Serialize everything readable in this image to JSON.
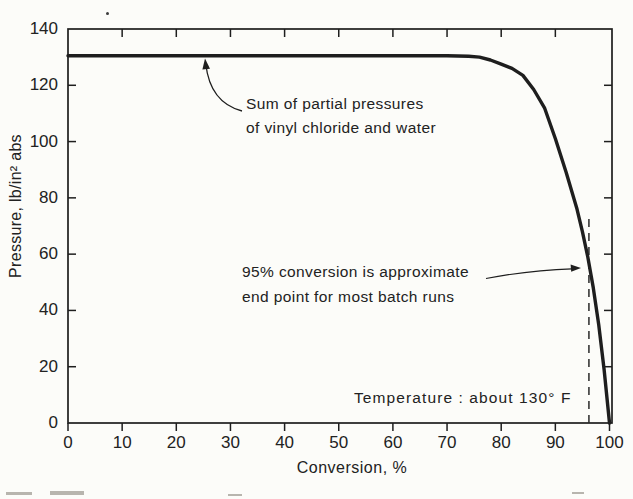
{
  "figure": {
    "background_color": "#fcfcf9",
    "ink_color": "#1e1e1e"
  },
  "chart_data": {
    "type": "line",
    "title": "",
    "xlabel": "Conversion, %",
    "ylabel": "Pressure, lb/in² abs",
    "xlim": [
      0,
      100
    ],
    "ylim": [
      0,
      140
    ],
    "x_ticks": [
      0,
      10,
      20,
      30,
      40,
      50,
      60,
      70,
      80,
      90,
      100
    ],
    "y_ticks": [
      0,
      20,
      40,
      60,
      80,
      100,
      120,
      140
    ],
    "grid": false,
    "frame": "box-with-inward-ticks",
    "legend_position": "none",
    "series": [
      {
        "name": "Sum of partial pressures of vinyl chloride and water",
        "points": [
          [
            0,
            130.5
          ],
          [
            10,
            130.5
          ],
          [
            20,
            130.5
          ],
          [
            30,
            130.5
          ],
          [
            40,
            130.5
          ],
          [
            50,
            130.5
          ],
          [
            60,
            130.5
          ],
          [
            70,
            130.5
          ],
          [
            74,
            130.3
          ],
          [
            76,
            130
          ],
          [
            78,
            129
          ],
          [
            80,
            127.5
          ],
          [
            82,
            126
          ],
          [
            84,
            123.5
          ],
          [
            86,
            118.5
          ],
          [
            88,
            112
          ],
          [
            90,
            101
          ],
          [
            92,
            89
          ],
          [
            94,
            76
          ],
          [
            95,
            68
          ],
          [
            96,
            59
          ],
          [
            97,
            48
          ],
          [
            98,
            35
          ],
          [
            99,
            19
          ],
          [
            100,
            0
          ]
        ]
      }
    ],
    "reference_line": {
      "style": "dashed-vertical",
      "x": 96.2,
      "y_from": 0,
      "y_to": 73,
      "meaning": "95% conversion end point"
    }
  },
  "annotations": {
    "partial_pressures": {
      "line1": "Sum of partial pressures",
      "line2": "of vinyl chloride and water"
    },
    "conversion_endpoint": {
      "line1": "95% conversion is approximate",
      "line2": "end point for most batch runs"
    },
    "temperature_note": "Temperature : about 130° F"
  }
}
